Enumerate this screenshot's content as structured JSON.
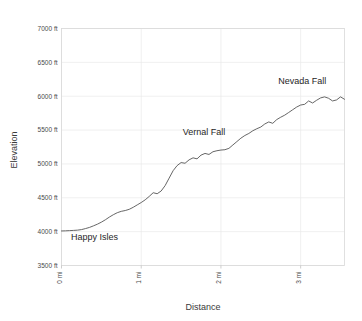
{
  "chart_data": {
    "type": "line",
    "title": "",
    "xlabel": "Distance",
    "ylabel": "Elevation",
    "xlim": [
      0,
      3.55
    ],
    "ylim": [
      3500,
      7000
    ],
    "grid": true,
    "legend": "none",
    "x_tick_labels": [
      "0 mi",
      "1 mi",
      "2 mi",
      "3 mi"
    ],
    "x_tick_values": [
      0,
      1,
      2,
      3
    ],
    "y_tick_labels": [
      "3500 ft",
      "4000 ft",
      "4500 ft",
      "5000 ft",
      "5500 ft",
      "6000 ft",
      "6500 ft",
      "7000 ft"
    ],
    "y_tick_values": [
      3500,
      4000,
      4500,
      5000,
      5500,
      6000,
      6500,
      7000
    ],
    "x_unit": "mi",
    "y_unit": "ft",
    "series": [
      {
        "name": "Elevation profile",
        "color": "#555555",
        "x": [
          0.0,
          0.05,
          0.1,
          0.15,
          0.2,
          0.25,
          0.3,
          0.35,
          0.4,
          0.45,
          0.5,
          0.55,
          0.6,
          0.65,
          0.7,
          0.75,
          0.8,
          0.85,
          0.9,
          0.95,
          1.0,
          1.05,
          1.1,
          1.15,
          1.2,
          1.25,
          1.3,
          1.35,
          1.4,
          1.45,
          1.5,
          1.55,
          1.6,
          1.65,
          1.7,
          1.75,
          1.8,
          1.85,
          1.9,
          1.95,
          2.0,
          2.05,
          2.1,
          2.15,
          2.2,
          2.25,
          2.3,
          2.35,
          2.4,
          2.45,
          2.5,
          2.55,
          2.6,
          2.65,
          2.7,
          2.75,
          2.8,
          2.85,
          2.9,
          2.95,
          3.0,
          3.05,
          3.1,
          3.15,
          3.2,
          3.25,
          3.3,
          3.35,
          3.4,
          3.45,
          3.5,
          3.55
        ],
        "y": [
          4010,
          4012,
          4015,
          4018,
          4022,
          4030,
          4045,
          4062,
          4085,
          4110,
          4140,
          4175,
          4215,
          4250,
          4280,
          4300,
          4312,
          4330,
          4360,
          4395,
          4430,
          4470,
          4520,
          4575,
          4560,
          4600,
          4680,
          4790,
          4900,
          4975,
          5020,
          5010,
          5060,
          5090,
          5075,
          5130,
          5155,
          5140,
          5180,
          5195,
          5205,
          5210,
          5230,
          5280,
          5330,
          5380,
          5420,
          5450,
          5490,
          5520,
          5545,
          5590,
          5620,
          5600,
          5655,
          5690,
          5720,
          5760,
          5800,
          5840,
          5870,
          5880,
          5930,
          5900,
          5940,
          5975,
          5990,
          5970,
          5930,
          5945,
          5990,
          5955
        ]
      }
    ],
    "annotations": [
      {
        "text": "Happy Isles",
        "x": 0.12,
        "y": 3880,
        "anchor": "start"
      },
      {
        "text": "Vernal Fall",
        "x": 1.52,
        "y": 5430,
        "anchor": "start"
      },
      {
        "text": "Nevada Fall",
        "x": 2.72,
        "y": 6180,
        "anchor": "start"
      }
    ]
  }
}
